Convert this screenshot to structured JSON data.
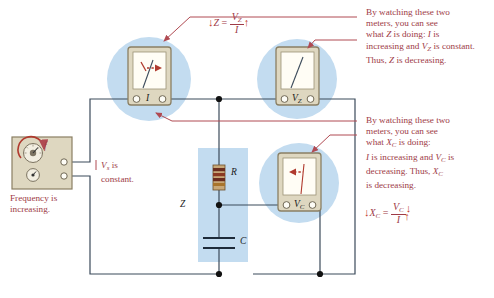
{
  "figure": {
    "type": "circuit-diagram",
    "background": "#ffffff",
    "wire_color": "#3b4a5a",
    "annotation_color": "#9e3b47",
    "arrow_color": "#c0392b",
    "highlight_color": "#c3dcf0",
    "instrument_body_color": "#ded7c0",
    "instrument_border_color": "#8a7f63"
  },
  "source": {
    "name": "signal-generator",
    "knob_label": "f",
    "caption_line1": "Frequency is",
    "caption_line2": "increasing.",
    "output_note_line1": "V",
    "output_note_sub": "s",
    "output_note_line1_rest": " is",
    "output_note_line2": "constant."
  },
  "meters": [
    {
      "id": "ammeter",
      "label": "I",
      "label_sub": "",
      "needle_direction": "up-right",
      "trend_arrow": "right",
      "trend": "increasing",
      "position": "top-left"
    },
    {
      "id": "voltmeter-z",
      "label": "V",
      "label_sub": "Z",
      "needle_direction": "up-right",
      "trend_arrow": "none",
      "trend": "constant",
      "position": "top-right"
    },
    {
      "id": "voltmeter-c",
      "label": "V",
      "label_sub": "C",
      "needle_direction": "up",
      "trend_arrow": "left",
      "trend": "decreasing",
      "position": "middle-right"
    }
  ],
  "components": [
    {
      "id": "resistor",
      "label": "R",
      "type": "resistor"
    },
    {
      "id": "capacitor",
      "label": "C",
      "type": "capacitor"
    },
    {
      "id": "impedance-block",
      "label": "Z",
      "type": "impedance"
    }
  ],
  "callouts": [
    {
      "id": "callout-z",
      "lines": [
        "By watching these two",
        "meters, you can see",
        "what Z is doing: I is",
        "increasing and V_Z is constant.",
        "Thus, Z is decreasing."
      ],
      "text": "By watching these two meters, you can see what Z is doing: I is increasing and VZ is constant. Thus, Z is decreasing."
    },
    {
      "id": "callout-xc",
      "lines": [
        "By watching these two",
        "meters, you can see",
        "what X_C is doing:",
        "I is increasing and V_C is",
        "decreasing. Thus, X_C",
        "is decreasing."
      ],
      "text": "By watching these two meters, you can see what XC is doing: I is increasing and VC is decreasing. Thus, XC is decreasing."
    }
  ],
  "equations": [
    {
      "id": "equation-z",
      "lhs": "Z",
      "lhs_arrow": "down",
      "numerator": "V",
      "numerator_sub": "Z",
      "numerator_arrow": "none",
      "denominator": "I",
      "denominator_arrow": "up",
      "text": "Z = VZ / I"
    },
    {
      "id": "equation-xc",
      "lhs": "X",
      "lhs_sub": "C",
      "lhs_arrow": "down",
      "numerator": "V",
      "numerator_sub": "C",
      "numerator_arrow": "down",
      "denominator": "I",
      "denominator_arrow": "up",
      "text": "XC = VC / I"
    }
  ]
}
